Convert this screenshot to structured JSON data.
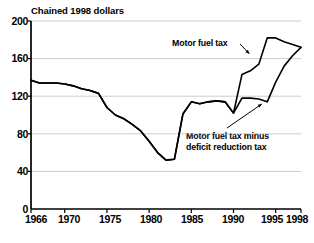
{
  "chart_data": {
    "type": "line",
    "title": "Chained 1998 dollars",
    "xlabel": "",
    "ylabel": "Chained 1998 dollars",
    "xlim": [
      1966,
      1998
    ],
    "ylim": [
      0,
      200
    ],
    "grid": true,
    "legend_position": "inline-annotations",
    "xticks": [
      "1966",
      "1970",
      "1975",
      "1980",
      "1985",
      "1990",
      "1995",
      "1998"
    ],
    "xtick_values": [
      1966,
      1970,
      1975,
      1980,
      1985,
      1990,
      1995,
      1998
    ],
    "yticks": [
      "0",
      "40",
      "80",
      "120",
      "160",
      "200"
    ],
    "ytick_values": [
      0,
      40,
      80,
      120,
      160,
      200
    ],
    "annotations": [
      {
        "text": "Motor fuel tax",
        "target_year": 1992,
        "target_value": 163
      },
      {
        "text_line1": "Motor fuel tax minus",
        "text_line2": "deficit reduction tax",
        "target_year": 1993,
        "target_value": 116
      }
    ],
    "series": [
      {
        "name": "Motor fuel tax",
        "x": [
          1966,
          1967,
          1968,
          1969,
          1970,
          1971,
          1972,
          1973,
          1974,
          1975,
          1976,
          1977,
          1978,
          1979,
          1980,
          1981,
          1982,
          1983,
          1984,
          1985,
          1986,
          1987,
          1988,
          1989,
          1990,
          1991,
          1992,
          1993,
          1994,
          1995,
          1996,
          1997,
          1998
        ],
        "values": [
          137,
          134,
          134,
          134,
          133,
          131,
          128,
          126,
          123,
          108,
          100,
          96,
          90,
          83,
          72,
          60,
          52,
          53,
          101,
          114,
          112,
          114,
          115,
          114,
          102,
          143,
          147,
          154,
          182,
          182,
          178,
          175,
          172
        ]
      },
      {
        "name": "Motor fuel tax minus deficit reduction tax",
        "x": [
          1966,
          1967,
          1968,
          1969,
          1970,
          1971,
          1972,
          1973,
          1974,
          1975,
          1976,
          1977,
          1978,
          1979,
          1980,
          1981,
          1982,
          1983,
          1984,
          1985,
          1986,
          1987,
          1988,
          1989,
          1990,
          1991,
          1992,
          1993,
          1994,
          1995,
          1996,
          1997,
          1998
        ],
        "values": [
          137,
          134,
          134,
          134,
          133,
          131,
          128,
          126,
          123,
          108,
          100,
          96,
          90,
          83,
          72,
          60,
          52,
          53,
          101,
          114,
          112,
          114,
          115,
          114,
          102,
          118,
          118,
          117,
          114,
          135,
          152,
          163,
          172
        ]
      }
    ]
  }
}
